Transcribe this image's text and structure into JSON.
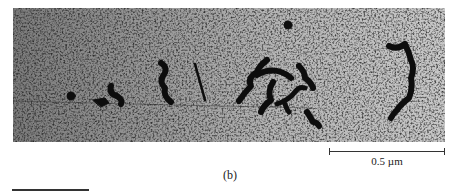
{
  "figure": {
    "panel_label": "(b)",
    "scale_bar": {
      "label": "0.5  µm",
      "value": 0.5,
      "unit": "µm"
    },
    "image": {
      "description": "Electron micrograph showing dark chain-like molecular strands on a grainy grey background",
      "background_color": "#8a8a8a",
      "feature_color": "#0a0a0a"
    }
  }
}
